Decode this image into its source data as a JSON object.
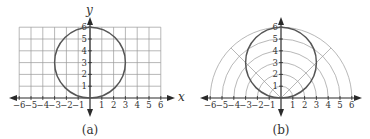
{
  "panels": [
    {
      "id": "a",
      "caption": "(a)",
      "type": "rectangular-grid",
      "x_axis_label": "x",
      "y_axis_label": "y",
      "x_ticks": [
        "−6",
        "−5",
        "−4",
        "−3",
        "−2",
        "−1",
        "1",
        "2",
        "3",
        "4",
        "5",
        "6"
      ],
      "y_ticks": [
        "1",
        "2",
        "3",
        "4",
        "5",
        "6"
      ],
      "curve": "circle centered at (0,3) radius 3"
    },
    {
      "id": "b",
      "caption": "(b)",
      "type": "polar-grid",
      "x_ticks": [
        "−6",
        "−5",
        "−4",
        "−3",
        "−2",
        "−1",
        "1",
        "2",
        "3",
        "4",
        "5",
        "6"
      ],
      "y_ticks": [
        "1",
        "2",
        "3",
        "4",
        "5",
        "6"
      ],
      "curve": "circle centered at (0,3) radius 3",
      "radial_rays_deg": [
        45,
        135
      ]
    }
  ],
  "colors": {
    "grid": "#9a9a9a",
    "axis": "#2a2a2a",
    "curve": "#555555"
  }
}
